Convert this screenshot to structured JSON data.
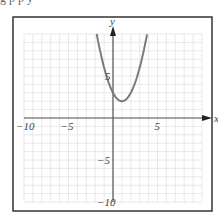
{
  "header": {
    "cut_off_text": "g p   p   y"
  },
  "chart_data": {
    "type": "line",
    "title": "",
    "xlabel": "x",
    "ylabel": "y",
    "xlim": [
      -10,
      10
    ],
    "ylim": [
      -10,
      10
    ],
    "grid": true,
    "x_ticks_labeled": [
      -10,
      -5,
      5
    ],
    "y_ticks_labeled": [
      5,
      -5,
      -10
    ],
    "function": "y = (x - 1)^2 + 2",
    "vertex": {
      "x": 1,
      "y": 2
    },
    "series": [
      {
        "name": "parabola",
        "color": "#7a7a7a",
        "x": [
          -1.83,
          -1.5,
          -1,
          -0.5,
          0,
          0.5,
          1,
          1.5,
          2,
          2.5,
          3,
          3.5,
          3.83
        ],
        "y": [
          10,
          8.25,
          6,
          4.25,
          3,
          2.25,
          2,
          2.25,
          3,
          4.25,
          6,
          8.25,
          10
        ]
      }
    ]
  },
  "colors": {
    "frame": "#333333",
    "grid": "#e2e2e2",
    "axis": "#555555",
    "curve": "#7a7a7a",
    "text": "#444444"
  }
}
